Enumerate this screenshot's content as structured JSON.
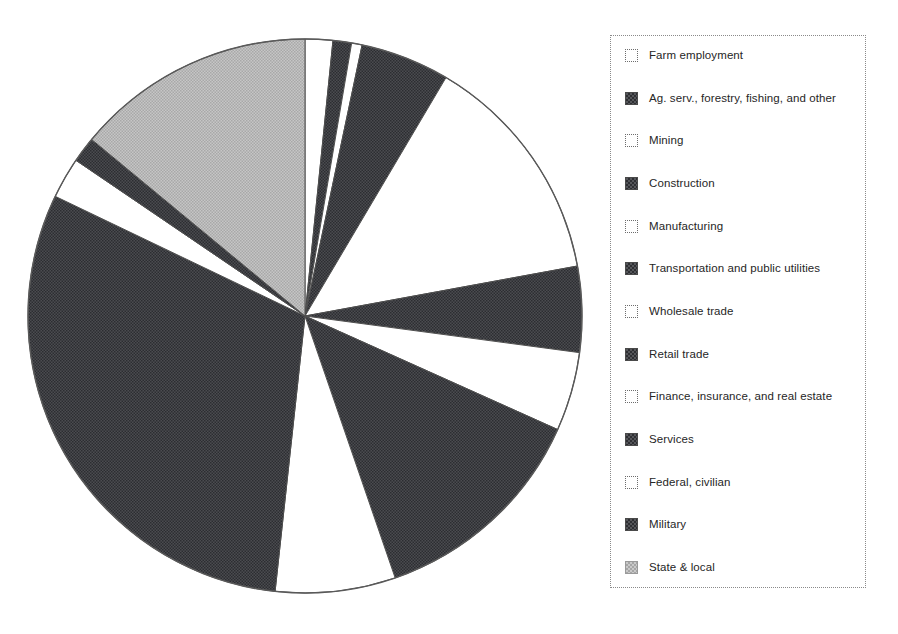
{
  "figure": {
    "background": "#ffffff",
    "width": 898,
    "height": 634
  },
  "legend": {
    "border_style": "dotted",
    "border_color": "#8a8a8a",
    "position": "right",
    "items": [
      {
        "label": "Farm employment",
        "swatch": "empty",
        "color": "#ffffff"
      },
      {
        "label": "Ag. serv., forestry, fishing, and other",
        "swatch": "dark",
        "color": "#3f4044"
      },
      {
        "label": "Mining",
        "swatch": "empty",
        "color": "#ffffff"
      },
      {
        "label": "Construction",
        "swatch": "dark",
        "color": "#3f4044"
      },
      {
        "label": "Manufacturing",
        "swatch": "empty",
        "color": "#ffffff"
      },
      {
        "label": "Transportation and public utilities",
        "swatch": "dark",
        "color": "#3f4044"
      },
      {
        "label": "Wholesale trade",
        "swatch": "empty",
        "color": "#ffffff"
      },
      {
        "label": "Retail trade",
        "swatch": "dark",
        "color": "#3f4044"
      },
      {
        "label": "Finance, insurance, and real estate",
        "swatch": "empty",
        "color": "#ffffff"
      },
      {
        "label": "Services",
        "swatch": "dark",
        "color": "#3f4044"
      },
      {
        "label": "Federal, civilian",
        "swatch": "empty",
        "color": "#ffffff"
      },
      {
        "label": "Military",
        "swatch": "dark",
        "color": "#3f4044"
      },
      {
        "label": "State & local",
        "swatch": "grey",
        "color": "#b9b9b9"
      }
    ]
  },
  "chart_data": {
    "type": "pie",
    "title": "",
    "subtitle": "",
    "xlabel": "",
    "ylabel": "",
    "grid": false,
    "legend_position": "right",
    "start_angle_deg": 90,
    "direction": "clockwise",
    "center_px": {
      "x": 305,
      "y": 316
    },
    "radius_px": 277,
    "outline_color": "#555555",
    "labels": [
      "Farm employment",
      "Ag. serv., forestry, fishing, and other",
      "Mining",
      "Construction",
      "Manufacturing",
      "Transportation and public utilities",
      "Wholesale trade",
      "Retail trade",
      "Finance, insurance, and real estate",
      "Services",
      "Federal, civilian",
      "Military",
      "State & local"
    ],
    "values": [
      1.6,
      1.1,
      0.6,
      5.2,
      13.6,
      5.0,
      4.6,
      13.0,
      7.0,
      30.4,
      2.4,
      1.5,
      14.0
    ],
    "units": "percent of total employment",
    "colors": [
      "#ffffff",
      "#3f4044",
      "#ffffff",
      "#3f4044",
      "#ffffff",
      "#3f4044",
      "#ffffff",
      "#3f4044",
      "#ffffff",
      "#3f4044",
      "#ffffff",
      "#3f4044",
      "#b9b9b9"
    ],
    "slices": [
      {
        "label": "Farm employment",
        "value": 1.6,
        "start_deg": 0.0,
        "end_deg": 5.8,
        "fill": "#ffffff"
      },
      {
        "label": "Ag. serv., forestry, fishing, and other",
        "value": 1.1,
        "start_deg": 5.8,
        "end_deg": 9.7,
        "fill": "#3f4044"
      },
      {
        "label": "Mining",
        "value": 0.6,
        "start_deg": 9.7,
        "end_deg": 11.9,
        "fill": "#ffffff"
      },
      {
        "label": "Construction",
        "value": 5.2,
        "start_deg": 11.9,
        "end_deg": 30.6,
        "fill": "#3f4044"
      },
      {
        "label": "Manufacturing",
        "value": 13.6,
        "start_deg": 30.6,
        "end_deg": 79.6,
        "fill": "#ffffff"
      },
      {
        "label": "Transportation and public utilities",
        "value": 5.0,
        "start_deg": 79.6,
        "end_deg": 97.6,
        "fill": "#3f4044"
      },
      {
        "label": "Wholesale trade",
        "value": 4.6,
        "start_deg": 97.6,
        "end_deg": 114.2,
        "fill": "#ffffff"
      },
      {
        "label": "Retail trade",
        "value": 13.0,
        "start_deg": 114.2,
        "end_deg": 161.0,
        "fill": "#3f4044"
      },
      {
        "label": "Finance, insurance, and real estate",
        "value": 7.0,
        "start_deg": 161.0,
        "end_deg": 186.2,
        "fill": "#ffffff"
      },
      {
        "label": "Services",
        "value": 30.4,
        "start_deg": 186.2,
        "end_deg": 295.6,
        "fill": "#3f4044"
      },
      {
        "label": "Federal, civilian",
        "value": 2.4,
        "start_deg": 295.6,
        "end_deg": 304.2,
        "fill": "#ffffff"
      },
      {
        "label": "Military",
        "value": 1.5,
        "start_deg": 304.2,
        "end_deg": 309.6,
        "fill": "#3f4044"
      },
      {
        "label": "State & local",
        "value": 14.0,
        "start_deg": 309.6,
        "end_deg": 360.0,
        "fill": "#b9b9b9"
      }
    ]
  }
}
